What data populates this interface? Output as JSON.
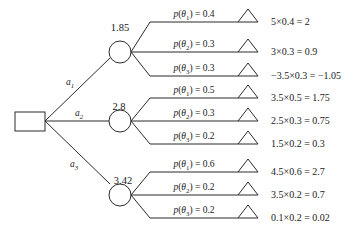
{
  "diagram": {
    "type": "decision-tree",
    "title_visible": false,
    "colors": {
      "stroke": "#2b2b2b",
      "text": "#1a1a1a",
      "background": "#ffffff"
    },
    "decision_node": {
      "shape": "rectangle",
      "label": ""
    },
    "branches": [
      {
        "action_label": "a",
        "action_sub": "1",
        "expected_value": "1.85",
        "outcomes": [
          {
            "prob_symbol": "p",
            "theta": "θ",
            "theta_sub": "1",
            "prob_text": "= 0.4",
            "payoff": "5×0.4 = 2"
          },
          {
            "prob_symbol": "p",
            "theta": "θ",
            "theta_sub": "2",
            "prob_text": "= 0.3",
            "payoff": "3×0.3 = 0.9"
          },
          {
            "prob_symbol": "p",
            "theta": "θ",
            "theta_sub": "3",
            "prob_text": "= 0.3",
            "payoff": "−3.5×0.3 = −1.05"
          }
        ]
      },
      {
        "action_label": "a",
        "action_sub": "2",
        "expected_value": "2.8",
        "outcomes": [
          {
            "prob_symbol": "p",
            "theta": "θ",
            "theta_sub": "1",
            "prob_text": "= 0.5",
            "payoff": "3.5×0.5 = 1.75"
          },
          {
            "prob_symbol": "p",
            "theta": "θ",
            "theta_sub": "2",
            "prob_text": "= 0.3",
            "payoff": "2.5×0.3 = 0.75"
          },
          {
            "prob_symbol": "p",
            "theta": "θ",
            "theta_sub": "3",
            "prob_text": "= 0.2",
            "payoff": "1.5×0.2 = 0.3"
          }
        ]
      },
      {
        "action_label": "a",
        "action_sub": "3",
        "expected_value": "3.42",
        "outcomes": [
          {
            "prob_symbol": "p",
            "theta": "θ",
            "theta_sub": "1",
            "prob_text": "= 0.6",
            "payoff": "4.5×0.6 = 2.7"
          },
          {
            "prob_symbol": "p",
            "theta": "θ",
            "theta_sub": "2",
            "prob_text": "= 0.2",
            "payoff": "3.5×0.2 = 0.7"
          },
          {
            "prob_symbol": "p",
            "theta": "θ",
            "theta_sub": "3",
            "prob_text": "= 0.2",
            "payoff": "0.1×0.2 = 0.02"
          }
        ]
      }
    ]
  }
}
